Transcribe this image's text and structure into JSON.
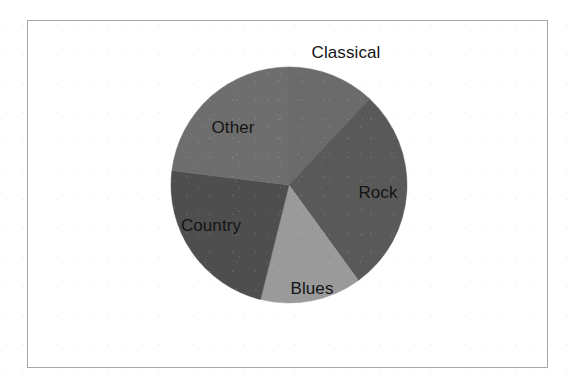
{
  "figure": {
    "background_color": "#ffffff",
    "frame": {
      "border_color": "#a6a6a6",
      "x": 27,
      "y": 20,
      "width": 521,
      "height": 348
    },
    "label_color": "#141414"
  },
  "chart_data": {
    "type": "pie",
    "title": "",
    "subtitle": "",
    "xlabel": "",
    "ylabel": "",
    "grid": false,
    "legend": "none",
    "labels_shown": true,
    "label_placement": "inside-slice",
    "start_angle_deg": 0,
    "direction": "clockwise",
    "center": {
      "cx": 289,
      "cy": 185
    },
    "radius": 118,
    "categories": [
      "Classical",
      "Rock",
      "Blues",
      "Country",
      "Other"
    ],
    "values": [
      12,
      28,
      14,
      23,
      23
    ],
    "units": "percent",
    "slices": [
      {
        "name": "Classical",
        "value": 12,
        "color": "#6b6b6b",
        "start_angle_deg": 0,
        "end_angle_deg": 43,
        "label": "Classical",
        "label_x": 346,
        "label_y": 52
      },
      {
        "name": "Rock",
        "value": 28,
        "color": "#595959",
        "start_angle_deg": 43,
        "end_angle_deg": 144,
        "label": "Rock",
        "label_x": 378,
        "label_y": 192
      },
      {
        "name": "Blues",
        "value": 14,
        "color": "#9a9a9a",
        "start_angle_deg": 144,
        "end_angle_deg": 194,
        "label": "Blues",
        "label_x": 312,
        "label_y": 288
      },
      {
        "name": "Country",
        "value": 23,
        "color": "#4e4e4e",
        "start_angle_deg": 194,
        "end_angle_deg": 277,
        "label": "Country",
        "label_x": 211,
        "label_y": 225
      },
      {
        "name": "Other",
        "value": 23,
        "color": "#6e6e6e",
        "start_angle_deg": 277,
        "end_angle_deg": 360,
        "label": "Other",
        "label_x": 233,
        "label_y": 127
      }
    ]
  }
}
